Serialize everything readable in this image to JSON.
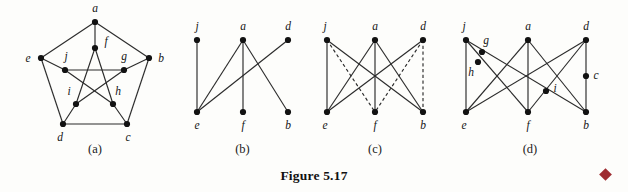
{
  "figure": {
    "caption": "Figure 5.17",
    "end_marker": "diamond-marker",
    "marker_color": "#9e2b30"
  },
  "panels": [
    {
      "id": "a",
      "label": "(a)",
      "name": "petersen-graph",
      "vertices": [
        {
          "id": "a",
          "label": "a",
          "x": 95,
          "y": 22,
          "lx": 95,
          "ly": 12
        },
        {
          "id": "e",
          "label": "e",
          "x": 41,
          "y": 58,
          "lx": 28,
          "ly": 62
        },
        {
          "id": "b",
          "label": "b",
          "x": 149,
          "y": 58,
          "lx": 161,
          "ly": 62
        },
        {
          "id": "d",
          "label": "d",
          "x": 63,
          "y": 124,
          "lx": 60,
          "ly": 141
        },
        {
          "id": "c",
          "label": "c",
          "x": 127,
          "y": 124,
          "lx": 128,
          "ly": 141
        },
        {
          "id": "f",
          "label": "f",
          "x": 95,
          "y": 48,
          "lx": 106,
          "ly": 45
        },
        {
          "id": "j",
          "label": "j",
          "x": 65,
          "y": 70,
          "lx": 66,
          "ly": 60
        },
        {
          "id": "g",
          "label": "g",
          "x": 124,
          "y": 70,
          "lx": 124,
          "ly": 60
        },
        {
          "id": "i",
          "label": "i",
          "x": 76,
          "y": 104,
          "lx": 69,
          "ly": 95
        },
        {
          "id": "h",
          "label": "h",
          "x": 113,
          "y": 104,
          "lx": 118,
          "ly": 95
        }
      ],
      "edges": [
        {
          "from": "a",
          "to": "e",
          "style": "solid"
        },
        {
          "from": "a",
          "to": "b",
          "style": "solid"
        },
        {
          "from": "e",
          "to": "d",
          "style": "solid"
        },
        {
          "from": "b",
          "to": "c",
          "style": "solid"
        },
        {
          "from": "d",
          "to": "c",
          "style": "solid"
        },
        {
          "from": "a",
          "to": "f",
          "style": "solid"
        },
        {
          "from": "e",
          "to": "j",
          "style": "solid"
        },
        {
          "from": "b",
          "to": "g",
          "style": "solid"
        },
        {
          "from": "d",
          "to": "i",
          "style": "solid"
        },
        {
          "from": "c",
          "to": "h",
          "style": "solid"
        },
        {
          "from": "f",
          "to": "i",
          "style": "solid"
        },
        {
          "from": "f",
          "to": "h",
          "style": "solid"
        },
        {
          "from": "j",
          "to": "g",
          "style": "solid"
        },
        {
          "from": "j",
          "to": "h",
          "style": "solid"
        },
        {
          "from": "g",
          "to": "i",
          "style": "solid"
        }
      ]
    },
    {
      "id": "b",
      "label": "(b)",
      "name": "subgraph-b",
      "vertices": [
        {
          "id": "j",
          "label": "j",
          "x": 22,
          "y": 40,
          "lx": 22,
          "ly": 30
        },
        {
          "id": "a",
          "label": "a",
          "x": 68,
          "y": 40,
          "lx": 68,
          "ly": 30
        },
        {
          "id": "d",
          "label": "d",
          "x": 113,
          "y": 40,
          "lx": 113,
          "ly": 30
        },
        {
          "id": "e",
          "label": "e",
          "x": 22,
          "y": 112,
          "lx": 22,
          "ly": 129
        },
        {
          "id": "f",
          "label": "f",
          "x": 68,
          "y": 112,
          "lx": 68,
          "ly": 129
        },
        {
          "id": "b",
          "label": "b",
          "x": 113,
          "y": 112,
          "lx": 113,
          "ly": 129
        }
      ],
      "edges": [
        {
          "from": "j",
          "to": "e",
          "style": "solid"
        },
        {
          "from": "a",
          "to": "e",
          "style": "solid"
        },
        {
          "from": "a",
          "to": "f",
          "style": "solid"
        },
        {
          "from": "a",
          "to": "b",
          "style": "solid"
        },
        {
          "from": "d",
          "to": "e",
          "style": "solid"
        }
      ]
    },
    {
      "id": "c",
      "label": "(c)",
      "name": "k33-with-dashed-edges",
      "vertices": [
        {
          "id": "j",
          "label": "j",
          "x": 22,
          "y": 40,
          "lx": 20,
          "ly": 30
        },
        {
          "id": "a",
          "label": "a",
          "x": 70,
          "y": 40,
          "lx": 70,
          "ly": 30
        },
        {
          "id": "d",
          "label": "d",
          "x": 118,
          "y": 40,
          "lx": 118,
          "ly": 30
        },
        {
          "id": "e",
          "label": "e",
          "x": 22,
          "y": 112,
          "lx": 20,
          "ly": 129
        },
        {
          "id": "f",
          "label": "f",
          "x": 70,
          "y": 112,
          "lx": 70,
          "ly": 129
        },
        {
          "id": "b",
          "label": "b",
          "x": 118,
          "y": 112,
          "lx": 118,
          "ly": 129
        }
      ],
      "edges": [
        {
          "from": "j",
          "to": "e",
          "style": "solid"
        },
        {
          "from": "j",
          "to": "b",
          "style": "solid"
        },
        {
          "from": "a",
          "to": "e",
          "style": "solid"
        },
        {
          "from": "a",
          "to": "f",
          "style": "solid"
        },
        {
          "from": "a",
          "to": "b",
          "style": "solid"
        },
        {
          "from": "d",
          "to": "e",
          "style": "solid"
        },
        {
          "from": "j",
          "to": "f",
          "style": "dashed"
        },
        {
          "from": "d",
          "to": "f",
          "style": "dashed"
        },
        {
          "from": "d",
          "to": "b",
          "style": "dashed"
        }
      ]
    },
    {
      "id": "d",
      "label": "(d)",
      "name": "subdivided-k33",
      "vertices": [
        {
          "id": "j",
          "label": "j",
          "x": 26,
          "y": 40,
          "lx": 24,
          "ly": 30
        },
        {
          "id": "a",
          "label": "a",
          "x": 88,
          "y": 40,
          "lx": 88,
          "ly": 30
        },
        {
          "id": "d",
          "label": "d",
          "x": 146,
          "y": 40,
          "lx": 146,
          "ly": 30
        },
        {
          "id": "e",
          "label": "e",
          "x": 26,
          "y": 112,
          "lx": 24,
          "ly": 129
        },
        {
          "id": "f",
          "label": "f",
          "x": 88,
          "y": 112,
          "lx": 88,
          "ly": 129
        },
        {
          "id": "b",
          "label": "b",
          "x": 146,
          "y": 112,
          "lx": 146,
          "ly": 129
        },
        {
          "id": "g",
          "label": "g",
          "x": 42,
          "y": 52,
          "lx": 46,
          "ly": 44
        },
        {
          "id": "h",
          "label": "h",
          "x": 38,
          "y": 62,
          "lx": 31,
          "ly": 76
        },
        {
          "id": "i",
          "label": "i",
          "x": 106,
          "y": 91,
          "lx": 115,
          "ly": 92
        },
        {
          "id": "c",
          "label": "c",
          "x": 146,
          "y": 76,
          "lx": 156,
          "ly": 79
        }
      ],
      "edges": [
        {
          "from": "j",
          "to": "e",
          "style": "solid"
        },
        {
          "from": "j",
          "to": "f",
          "style": "solid"
        },
        {
          "from": "j",
          "to": "b",
          "style": "solid"
        },
        {
          "from": "a",
          "to": "e",
          "style": "solid"
        },
        {
          "from": "a",
          "to": "f",
          "style": "solid"
        },
        {
          "from": "a",
          "to": "b",
          "style": "solid"
        },
        {
          "from": "d",
          "to": "e",
          "style": "solid"
        },
        {
          "from": "d",
          "to": "f",
          "style": "solid"
        },
        {
          "from": "d",
          "to": "b",
          "style": "solid"
        }
      ]
    }
  ]
}
